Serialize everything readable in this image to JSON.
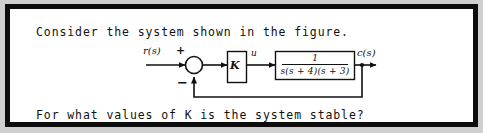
{
  "figure": {
    "border_color": "#0d0d0d",
    "background_color": "#ffffff",
    "prompt_top": "Consider the system shown in the figure.",
    "prompt_bottom": "For what values of K is the system stable?"
  },
  "diagram": {
    "input_label": "r(s)",
    "summing_plus": "+",
    "summing_minus": "−",
    "gain_label": "K",
    "intermediate_signal": "u",
    "transfer_function": {
      "numerator": "1",
      "denominator": "s(s + 4)(s + 3)"
    },
    "output_label": "c(s)",
    "line_color": "#111111"
  }
}
